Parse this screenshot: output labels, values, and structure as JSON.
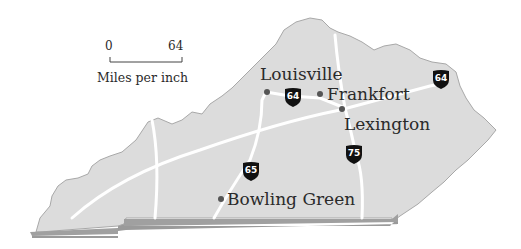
{
  "map": {
    "region": "Kentucky",
    "colors": {
      "land": "#dcdcdc",
      "shadow": "#9a9a9a",
      "roads": "#ffffff",
      "shield": "#111111",
      "text": "#2a2a2a",
      "dot": "#555555"
    },
    "scale": {
      "start": "0",
      "end": "64",
      "caption": "Miles per inch"
    },
    "cities": [
      {
        "name": "Louisville"
      },
      {
        "name": "Frankfort"
      },
      {
        "name": "Lexington"
      },
      {
        "name": "Bowling Green"
      }
    ],
    "interstates": [
      {
        "number": "64"
      },
      {
        "number": "64"
      },
      {
        "number": "65"
      },
      {
        "number": "75"
      }
    ]
  }
}
